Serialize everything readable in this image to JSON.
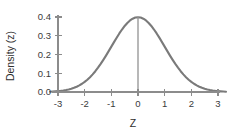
{
  "chart_data": {
    "type": "line",
    "title": "",
    "subtitle": "",
    "xlabel": "Z",
    "ylabel": "Density (z)",
    "xlim": [
      -3.3,
      3.3
    ],
    "ylim": [
      0.0,
      0.42
    ],
    "grid": false,
    "legend": false,
    "legend_position": "none",
    "xticks": [
      -3,
      -2,
      -1,
      0,
      1,
      2,
      3
    ],
    "xticklabels": [
      "-3",
      "-2",
      "-1",
      "0",
      "1",
      "2",
      "3"
    ],
    "yticks": [
      0.0,
      0.1,
      0.2,
      0.3,
      0.4
    ],
    "yticklabels": [
      "0.0",
      "0.1",
      "0.2",
      "0.3",
      "0.4"
    ],
    "annotations": [
      {
        "name": "center-vertical-line",
        "x": 0,
        "y_from": 0.0,
        "y_to": 0.3989
      }
    ],
    "series": [
      {
        "name": "standard normal density",
        "color": "#7a7a7a",
        "x": [
          -3.3,
          -3.2,
          -3.1,
          -3.0,
          -2.9,
          -2.8,
          -2.7,
          -2.6,
          -2.5,
          -2.4,
          -2.3,
          -2.2,
          -2.1,
          -2.0,
          -1.9,
          -1.8,
          -1.7,
          -1.6,
          -1.5,
          -1.4,
          -1.3,
          -1.2,
          -1.1,
          -1.0,
          -0.9,
          -0.8,
          -0.7,
          -0.6,
          -0.5,
          -0.4,
          -0.3,
          -0.2,
          -0.1,
          0.0,
          0.1,
          0.2,
          0.3,
          0.4,
          0.5,
          0.6,
          0.7,
          0.8,
          0.9,
          1.0,
          1.1,
          1.2,
          1.3,
          1.4,
          1.5,
          1.6,
          1.7,
          1.8,
          1.9,
          2.0,
          2.1,
          2.2,
          2.3,
          2.4,
          2.5,
          2.6,
          2.7,
          2.8,
          2.9,
          3.0,
          3.1,
          3.2,
          3.3
        ],
        "y": [
          0.0017,
          0.0024,
          0.0033,
          0.0044,
          0.006,
          0.0079,
          0.0104,
          0.0136,
          0.0175,
          0.0224,
          0.0283,
          0.0355,
          0.044,
          0.054,
          0.0656,
          0.079,
          0.094,
          0.1109,
          0.1295,
          0.1497,
          0.1714,
          0.1942,
          0.2179,
          0.242,
          0.2661,
          0.2897,
          0.3123,
          0.3332,
          0.3521,
          0.3683,
          0.3814,
          0.391,
          0.397,
          0.3989,
          0.397,
          0.391,
          0.3814,
          0.3683,
          0.3521,
          0.3332,
          0.3123,
          0.2897,
          0.2661,
          0.242,
          0.2179,
          0.1942,
          0.1714,
          0.1497,
          0.1295,
          0.1109,
          0.094,
          0.079,
          0.0656,
          0.054,
          0.044,
          0.0355,
          0.0283,
          0.0224,
          0.0175,
          0.0136,
          0.0104,
          0.0079,
          0.006,
          0.0044,
          0.0033,
          0.0024,
          0.0017
        ]
      }
    ],
    "colors": {
      "curve": "#7a7a7a",
      "axis": "#8c8c8c",
      "center_line": "#9a9a9a",
      "text": "#3a3a3a",
      "background": "#ffffff"
    }
  }
}
